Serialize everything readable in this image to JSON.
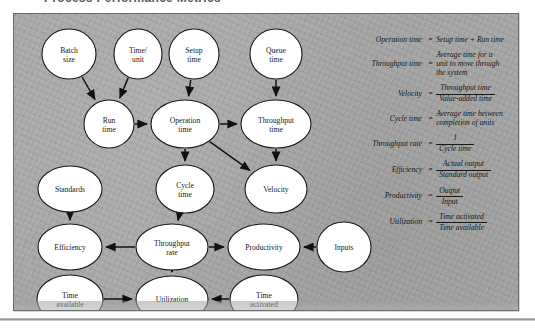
{
  "title": "Process Performance Metrics",
  "colors": {
    "panel_background": "#a8a8a8",
    "panel_border": "#6b6b6b",
    "node_fill": "#ffffff",
    "node_stroke": "#1a1a1a",
    "arrow": "#111111",
    "text": "#16181a"
  },
  "diagram": {
    "nodes": [
      {
        "id": "batch_size",
        "label_line1": "Batch",
        "label_line2": "size",
        "cx": 55,
        "cy": 40,
        "rx": 27,
        "ry": 25
      },
      {
        "id": "time_unit",
        "label_line1": "Time/",
        "label_line2": "unit",
        "cx": 124,
        "cy": 40,
        "rx": 24,
        "ry": 25
      },
      {
        "id": "setup_time",
        "label_line1": "Setup",
        "label_line2": "time",
        "cx": 180,
        "cy": 40,
        "rx": 25,
        "ry": 25
      },
      {
        "id": "queue_time",
        "label_line1": "Queue",
        "label_line2": "time",
        "cx": 262,
        "cy": 40,
        "rx": 26,
        "ry": 25
      },
      {
        "id": "run_time",
        "label_line1": "Run",
        "label_line2": "time",
        "cx": 95,
        "cy": 110,
        "rx": 25,
        "ry": 24
      },
      {
        "id": "operation_time",
        "label_line1": "Operation",
        "label_line2": "time",
        "cx": 171,
        "cy": 110,
        "rx": 34,
        "ry": 24
      },
      {
        "id": "throughput_time",
        "label_line1": "Throughput",
        "label_line2": "time",
        "cx": 262,
        "cy": 110,
        "rx": 35,
        "ry": 24
      },
      {
        "id": "cycle_time",
        "label_line1": "Cycle",
        "label_line2": "time",
        "cx": 171,
        "cy": 175,
        "rx": 29,
        "ry": 24
      },
      {
        "id": "velocity",
        "label_line1": "Velocity",
        "label_line2": "",
        "cx": 262,
        "cy": 175,
        "rx": 31,
        "ry": 24
      },
      {
        "id": "standards",
        "label_line1": "Standards",
        "label_line2": "",
        "cx": 56,
        "cy": 175,
        "rx": 32,
        "ry": 23
      },
      {
        "id": "efficiency",
        "label_line1": "Efficiency",
        "label_line2": "",
        "cx": 56,
        "cy": 233,
        "rx": 32,
        "ry": 23
      },
      {
        "id": "throughput_rate",
        "label_line1": "Throughput",
        "label_line2": "rate",
        "cx": 158,
        "cy": 233,
        "rx": 36,
        "ry": 23
      },
      {
        "id": "productivity",
        "label_line1": "Productivity",
        "label_line2": "",
        "cx": 250,
        "cy": 233,
        "rx": 36,
        "ry": 23
      },
      {
        "id": "inputs",
        "label_line1": "Inputs",
        "label_line2": "",
        "cx": 330,
        "cy": 233,
        "rx": 27,
        "ry": 25
      },
      {
        "id": "time_available",
        "label_line1": "Time",
        "label_line2": "available",
        "cx": 56,
        "cy": 285,
        "rx": 33,
        "ry": 24
      },
      {
        "id": "utilization",
        "label_line1": "Utilization",
        "label_line2": "",
        "cx": 158,
        "cy": 285,
        "rx": 36,
        "ry": 23
      },
      {
        "id": "time_activated",
        "label_line1": "Time",
        "label_line2": "activated",
        "cx": 250,
        "cy": 285,
        "rx": 34,
        "ry": 24
      }
    ],
    "edges": [
      {
        "from": "batch_size",
        "to": "run_time"
      },
      {
        "from": "time_unit",
        "to": "run_time"
      },
      {
        "from": "setup_time",
        "to": "operation_time"
      },
      {
        "from": "queue_time",
        "to": "throughput_time"
      },
      {
        "from": "run_time",
        "to": "operation_time"
      },
      {
        "from": "operation_time",
        "to": "throughput_time"
      },
      {
        "from": "operation_time",
        "to": "cycle_time"
      },
      {
        "from": "operation_time",
        "to": "velocity"
      },
      {
        "from": "throughput_time",
        "to": "velocity"
      },
      {
        "from": "cycle_time",
        "to": "throughput_rate"
      },
      {
        "from": "standards",
        "to": "efficiency"
      },
      {
        "from": "throughput_rate",
        "to": "efficiency"
      },
      {
        "from": "throughput_rate",
        "to": "productivity"
      },
      {
        "from": "throughput_rate",
        "to": "utilization"
      },
      {
        "from": "inputs",
        "to": "productivity"
      },
      {
        "from": "time_available",
        "to": "utilization"
      },
      {
        "from": "time_activated",
        "to": "utilization"
      }
    ]
  },
  "equations": [
    {
      "id": "operation-time",
      "lhs": "Operation time",
      "eq": "=",
      "kind": "plain",
      "rhs_lines": [
        "Setup time  +  Run time"
      ]
    },
    {
      "id": "throughput-time",
      "lhs": "Throughput time",
      "eq": "=",
      "kind": "plain",
      "rhs_lines": [
        "Average time for a",
        "unit to move through",
        "the system"
      ]
    },
    {
      "id": "velocity",
      "lhs": "Velocity",
      "eq": "=",
      "kind": "fraction",
      "numerator": "Throughput time",
      "denominator": "Value-added time"
    },
    {
      "id": "cycle-time",
      "lhs": "Cycle time",
      "eq": "=",
      "kind": "plain",
      "rhs_lines": [
        "Average time between",
        "completion of units"
      ]
    },
    {
      "id": "throughput-rate",
      "lhs": "Throughput rate",
      "eq": "=",
      "kind": "fraction",
      "numerator": "1",
      "denominator": "Cycle time"
    },
    {
      "id": "efficiency",
      "lhs": "Efficiency",
      "eq": "=",
      "kind": "fraction",
      "numerator": "Actual output",
      "denominator": "Standard output"
    },
    {
      "id": "productivity",
      "lhs": "Productivity",
      "eq": "=",
      "kind": "fraction",
      "numerator": "Output",
      "denominator": "Input"
    },
    {
      "id": "utilization",
      "lhs": "Utilization",
      "eq": "=",
      "kind": "fraction",
      "numerator": "Time activated",
      "denominator": "Time available"
    }
  ]
}
